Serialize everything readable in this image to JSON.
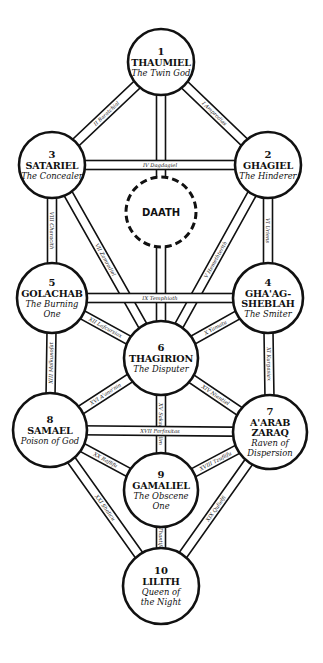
{
  "diagram": {
    "colors": {
      "line": "#111111",
      "background": "#ffffff"
    },
    "nodes": [
      {
        "id": "1",
        "number": "1",
        "name_lines": [
          "THAUMIEL"
        ],
        "title_lines": [
          "The Twin God"
        ],
        "cx": 161,
        "cy": 62,
        "r": 33
      },
      {
        "id": "2",
        "number": "2",
        "name_lines": [
          "GHAGIEL"
        ],
        "title_lines": [
          "The Hinderer"
        ],
        "cx": 268,
        "cy": 165,
        "r": 33
      },
      {
        "id": "3",
        "number": "3",
        "name_lines": [
          "SATARIEL"
        ],
        "title_lines": [
          "The Concealer"
        ],
        "cx": 52,
        "cy": 165,
        "r": 33
      },
      {
        "id": "4",
        "number": "4",
        "name_lines": [
          "GHA'AG-",
          "SHEBLAH"
        ],
        "title_lines": [
          "The Smiter"
        ],
        "cx": 268,
        "cy": 298,
        "r": 35
      },
      {
        "id": "5",
        "number": "5",
        "name_lines": [
          "GOLACHAB"
        ],
        "title_lines": [
          "The Burning",
          "One"
        ],
        "cx": 52,
        "cy": 298,
        "r": 35
      },
      {
        "id": "6",
        "number": "6",
        "name_lines": [
          "THAGIRION"
        ],
        "title_lines": [
          "The Disputer"
        ],
        "cx": 161,
        "cy": 358,
        "r": 37
      },
      {
        "id": "7",
        "number": "7",
        "name_lines": [
          "A'ARAB",
          "ZARAQ"
        ],
        "title_lines": [
          "Raven of",
          "Dispersion"
        ],
        "cx": 270,
        "cy": 432,
        "r": 37
      },
      {
        "id": "8",
        "number": "8",
        "name_lines": [
          "SAMAEL"
        ],
        "title_lines": [
          "Poison of God"
        ],
        "cx": 50,
        "cy": 430,
        "r": 37
      },
      {
        "id": "9",
        "number": "9",
        "name_lines": [
          "GAMALIEL"
        ],
        "title_lines": [
          "The Obscene",
          "One"
        ],
        "cx": 161,
        "cy": 490,
        "r": 37
      },
      {
        "id": "10",
        "number": "10",
        "name_lines": [
          "LILITH"
        ],
        "title_lines": [
          "Queen of",
          "the Night"
        ],
        "cx": 161,
        "cy": 586,
        "r": 38
      }
    ],
    "daath": {
      "name": "DAATH",
      "cx": 161,
      "cy": 212,
      "r": 35
    },
    "paths": [
      {
        "label": "I Amprodias",
        "from": "1",
        "to": "2"
      },
      {
        "label": "II Baratchial",
        "from": "1",
        "to": "3"
      },
      {
        "label": "III Gargophias",
        "from": "1",
        "to": "6"
      },
      {
        "label": "IV Dagdagiel",
        "from": "3",
        "to": "2"
      },
      {
        "label": "V Hemethterith",
        "from": "2",
        "to": "6"
      },
      {
        "label": "VI Uriens",
        "from": "2",
        "to": "4"
      },
      {
        "label": "VII Zamradiel",
        "from": "3",
        "to": "6"
      },
      {
        "label": "VIII Characith",
        "from": "3",
        "to": "5"
      },
      {
        "label": "IX Temphioth",
        "from": "5",
        "to": "4"
      },
      {
        "label": "X Yamatu",
        "from": "4",
        "to": "6"
      },
      {
        "label": "XI Kurgasiax",
        "from": "4",
        "to": "7"
      },
      {
        "label": "XII Lafcursiax",
        "from": "5",
        "to": "6"
      },
      {
        "label": "XIII Malkunofat",
        "from": "5",
        "to": "8"
      },
      {
        "label": "XIV Niantiel",
        "from": "6",
        "to": "7"
      },
      {
        "label": "XV Saksaksalim",
        "from": "6",
        "to": "9"
      },
      {
        "label": "XVI A'ano'nin",
        "from": "6",
        "to": "8"
      },
      {
        "label": "XVII Parfaxitas",
        "from": "8",
        "to": "7"
      },
      {
        "label": "XVIII Tzuflifu",
        "from": "7",
        "to": "9"
      },
      {
        "label": "XIX Qulielfi",
        "from": "7",
        "to": "10"
      },
      {
        "label": "XX Raflifu",
        "from": "8",
        "to": "9"
      },
      {
        "label": "XXI Shalicu",
        "from": "8",
        "to": "10"
      },
      {
        "label": "XXII Thantifaxath",
        "from": "9",
        "to": "10"
      }
    ]
  }
}
